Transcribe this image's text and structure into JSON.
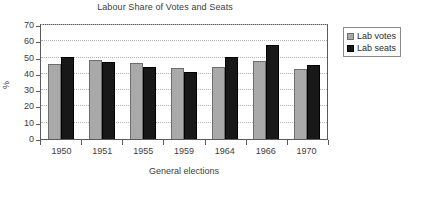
{
  "chart_data": {
    "type": "bar",
    "title": "Labour Share of Votes and Seats",
    "xlabel": "General elections",
    "ylabel": "%",
    "categories": [
      "1950",
      "1951",
      "1955",
      "1959",
      "1964",
      "1966",
      "1970"
    ],
    "series": [
      {
        "name": "Lab votes",
        "color": "#a9a9a9",
        "values": [
          46.0,
          48.8,
          46.4,
          43.8,
          44.1,
          48.0,
          43.0
        ]
      },
      {
        "name": "Lab seats",
        "color": "#181818",
        "values": [
          50.4,
          47.2,
          44.0,
          41.0,
          50.3,
          57.6,
          45.7
        ]
      }
    ],
    "ylim": [
      0,
      70
    ],
    "yticks": [
      0,
      10,
      20,
      30,
      40,
      50,
      60,
      70
    ],
    "ytick_labels": [
      "0",
      "10",
      "20",
      "30",
      "40",
      "50",
      "60",
      "70"
    ],
    "grid": "horizontal-dotted",
    "legend_position": "right",
    "legend_entries": [
      "Lab votes",
      "Lab seats"
    ]
  },
  "colors": {
    "votes": "#a9a9a9",
    "votes_border": "#6e6e6e",
    "seats": "#181818",
    "seats_border": "#000000",
    "axis": "#5a5a5a",
    "grid": "#b5b5b5",
    "text": "#3d3d3d",
    "background": "#ffffff"
  }
}
